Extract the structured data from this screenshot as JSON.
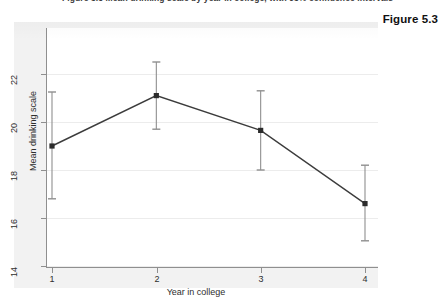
{
  "page": {
    "top_caption": "Figure 5.3  Mean drinking scale by year in college, with 95% confidence intervals",
    "figure_number": "Figure 5.3"
  },
  "colors": {
    "panel_background": "#f2f2f2",
    "plot_background": "#ffffff",
    "axis": "#8f8f8f",
    "grid": "#ececec",
    "series_line": "#3c3c3c",
    "error_bar": "#8f8f8f",
    "marker": "#2b2b2b",
    "text": "#2e2e2e"
  },
  "chart_data": {
    "type": "line",
    "title": "",
    "subtitle": "",
    "xlabel": "Year in college",
    "ylabel": "Mean drinking scale",
    "x": [
      1,
      2,
      3,
      4
    ],
    "xtick_labels": [
      "1",
      "2",
      "3",
      "4"
    ],
    "ytick_labels": [
      "14",
      "16",
      "18",
      "20",
      "22"
    ],
    "yticks": [
      14,
      16,
      18,
      20,
      22
    ],
    "xlim": [
      0.8,
      4.25
    ],
    "ylim": [
      13.4,
      22.9
    ],
    "grid": true,
    "grid_axis": "y",
    "legend": "none",
    "series": [
      {
        "name": "Mean drinking scale",
        "values": [
          19.0,
          21.1,
          19.65,
          16.6
        ],
        "error_low": [
          16.8,
          19.7,
          18.0,
          15.05
        ],
        "error_high": [
          21.25,
          22.5,
          21.3,
          18.2
        ],
        "marker": "square",
        "error_bar_type": "95% confidence interval"
      }
    ],
    "annotations": []
  }
}
